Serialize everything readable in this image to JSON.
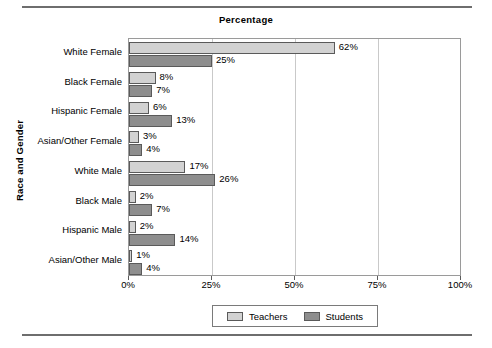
{
  "chart_data": {
    "type": "bar",
    "orientation": "horizontal",
    "title": "Percentage",
    "xlabel": "",
    "ylabel": "Race and Gender",
    "xlim": [
      0,
      100
    ],
    "xticks": [
      "0%",
      "25%",
      "50%",
      "75%",
      "100%"
    ],
    "xtick_values": [
      0,
      25,
      50,
      75,
      100
    ],
    "grid": true,
    "legend_position": "bottom",
    "categories": [
      "White Female",
      "Black Female",
      "Hispanic Female",
      "Asian/Other Female",
      "White Male",
      "Black Male",
      "Hispanic Male",
      "Asian/Other Male"
    ],
    "series": [
      {
        "name": "Teachers",
        "color": "#d2d2d2",
        "values": [
          62,
          8,
          6,
          3,
          17,
          2,
          2,
          1
        ],
        "labels": [
          "62%",
          "8%",
          "6%",
          "3%",
          "17%",
          "2%",
          "2%",
          "1%"
        ]
      },
      {
        "name": "Students",
        "color": "#8e8e8e",
        "values": [
          25,
          7,
          13,
          4,
          26,
          7,
          14,
          4
        ],
        "labels": [
          "25%",
          "7%",
          "13%",
          "4%",
          "26%",
          "7%",
          "14%",
          "4%"
        ]
      }
    ]
  },
  "colors": {
    "teachers": "#d2d2d2",
    "students": "#8e8e8e",
    "bar_border": "#5a5a5a",
    "gridline": "#c9c9c9",
    "frame": "#9a9a9a",
    "rule": "#6e6e6e"
  }
}
